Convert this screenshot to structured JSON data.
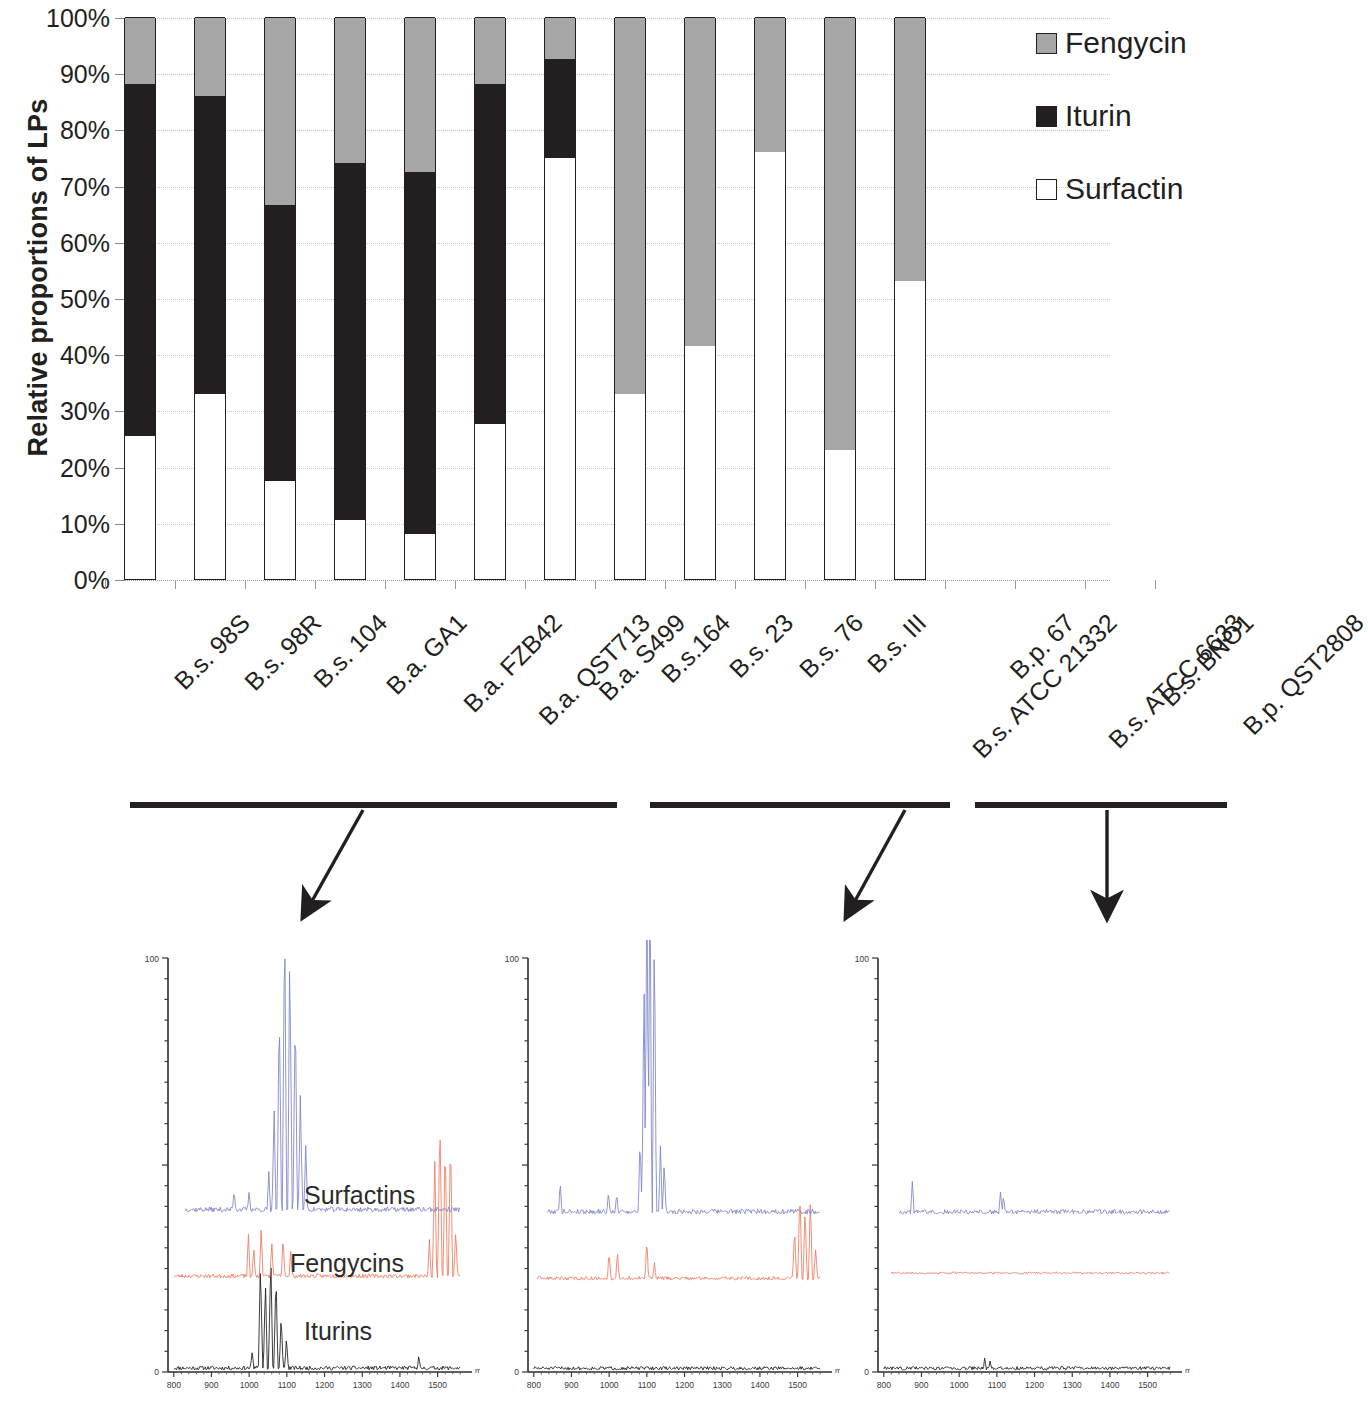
{
  "chart_data": {
    "type": "bar",
    "subtype": "stacked-100-percent",
    "title": "",
    "xlabel": "",
    "ylabel": "Relative proportions of LPs",
    "ylim": [
      0,
      100
    ],
    "yunit": "%",
    "ytick_labels": [
      "0%",
      "10%",
      "20%",
      "30%",
      "40%",
      "50%",
      "60%",
      "70%",
      "80%",
      "90%",
      "100%"
    ],
    "ytick_values": [
      0,
      10,
      20,
      30,
      40,
      50,
      60,
      70,
      80,
      90,
      100
    ],
    "grid": true,
    "legend_position": "right",
    "categories": [
      "B.s. 98S",
      "B.s. 98R",
      "B.s. 104",
      "B.a. GA1",
      "B.a. FZB42",
      "B.a. QST713",
      "B.a. S499",
      "B.s.164",
      "B.s. 23",
      "B.s. 76",
      "B.s. III",
      "B.s. ATCC 21332",
      "B.p. 67",
      "B.s. ATCC 6633",
      "B.s. BNO1",
      "B.p. QST2808"
    ],
    "series": [
      {
        "name": "Surfactin",
        "color": "#ffffff",
        "values": [
          25.5,
          33,
          17.5,
          10.5,
          8,
          27.5,
          75,
          33,
          41.5,
          76,
          23,
          53,
          0,
          0,
          0,
          0
        ]
      },
      {
        "name": "Iturin",
        "color": "#231f20",
        "values": [
          62.5,
          53,
          49,
          63.5,
          64.5,
          60.5,
          17.5,
          0,
          0,
          0,
          0,
          0,
          0,
          0,
          0,
          0
        ]
      },
      {
        "name": "Fengycin",
        "color": "#a6a6a6",
        "values": [
          12,
          14,
          33.5,
          26,
          27.5,
          12,
          7.5,
          67,
          58.5,
          24,
          77,
          47,
          0,
          0,
          0,
          0
        ]
      }
    ],
    "legend_order": [
      "Fengycin",
      "Iturin",
      "Surfactin"
    ],
    "empty_categories": [
      "B.p. 67",
      "B.s. ATCC 6633",
      "B.s. BNO1",
      "B.p. QST2808"
    ]
  },
  "legend": {
    "items": [
      {
        "label": "Fengycin",
        "color": "#a6a6a6"
      },
      {
        "label": "Iturin",
        "color": "#231f20"
      },
      {
        "label": "Surfactin",
        "color": "#ffffff"
      }
    ]
  },
  "groups": {
    "brackets": [
      {
        "label": "",
        "spans": "B.s. 98S - B.a. S499"
      },
      {
        "label": "",
        "spans": "B.s.164 - B.s. ATCC 21332"
      },
      {
        "label": "",
        "spans": "B.p. 67 - B.p. QST2808"
      }
    ]
  },
  "spectra": {
    "axis": {
      "ytick_labels": [
        "100",
        "0"
      ],
      "xtick_labels": [
        "800",
        "900",
        "1000",
        "1100",
        "1200",
        "1300",
        "1400",
        "1500"
      ],
      "xaxis_title": "m/z"
    },
    "traces": [
      {
        "name": "Surfactins",
        "color": "#7b84c8"
      },
      {
        "name": "Fengycins",
        "color": "#ed7a5e"
      },
      {
        "name": "Iturins",
        "color": "#1a1a1a"
      }
    ],
    "panels": [
      {
        "id": "panel-1",
        "annotations": [
          "Surfactins",
          "Fengycins",
          "Iturins"
        ],
        "xtick_labels": [
          "800",
          "900",
          "1000",
          "1100",
          "1200",
          "1300",
          "1400",
          "1500"
        ],
        "ytick_labels": [
          "100",
          "0"
        ],
        "xaxis_title": "m/z"
      },
      {
        "id": "panel-2",
        "annotations": [],
        "xtick_labels": [
          "800",
          "900",
          "1000",
          "1100",
          "1200",
          "1300",
          "1400",
          "1500"
        ],
        "ytick_labels": [
          "100",
          "0"
        ],
        "xaxis_title": "m/z"
      },
      {
        "id": "panel-3",
        "annotations": [],
        "xtick_labels": [
          "800",
          "900",
          "1000",
          "1100",
          "1200",
          "1300",
          "1400",
          "1500"
        ],
        "ytick_labels": [
          "100",
          "0"
        ],
        "xaxis_title": "m/z"
      }
    ]
  }
}
